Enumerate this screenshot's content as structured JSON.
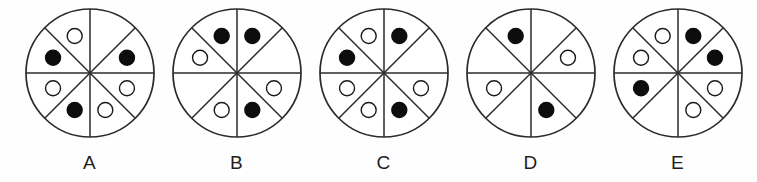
{
  "figure": {
    "background_color": "#fefefe",
    "stroke_color": "#2b2b2b",
    "dot_fill_black": "#0d0d0d",
    "dot_fill_white": "#ffffff",
    "dot_stroke_color": "#1a1a1a",
    "sector_count": 8,
    "circle_radius": 64,
    "dot_radius": 7.5,
    "dot_orbit_radius": 40,
    "sector_names": [
      "top-right",
      "right-upper",
      "right-lower",
      "bottom-right",
      "bottom-left",
      "left-lower",
      "left-upper",
      "top-left"
    ],
    "items": [
      {
        "label": "A",
        "name": "circle-a",
        "black_count": 3,
        "white_count": 4,
        "empty_count": 1,
        "sectors": [
          {
            "sector": "top-right",
            "dot": "none"
          },
          {
            "sector": "right-upper",
            "dot": "black"
          },
          {
            "sector": "right-lower",
            "dot": "white"
          },
          {
            "sector": "bottom-right",
            "dot": "white"
          },
          {
            "sector": "bottom-left",
            "dot": "black"
          },
          {
            "sector": "left-lower",
            "dot": "white"
          },
          {
            "sector": "left-upper",
            "dot": "black"
          },
          {
            "sector": "top-left",
            "dot": "white"
          }
        ]
      },
      {
        "label": "B",
        "name": "circle-b",
        "black_count": 3,
        "white_count": 3,
        "empty_count": 2,
        "sectors": [
          {
            "sector": "top-right",
            "dot": "black"
          },
          {
            "sector": "right-upper",
            "dot": "none"
          },
          {
            "sector": "right-lower",
            "dot": "white"
          },
          {
            "sector": "bottom-right",
            "dot": "black"
          },
          {
            "sector": "bottom-left",
            "dot": "white"
          },
          {
            "sector": "left-lower",
            "dot": "none"
          },
          {
            "sector": "left-upper",
            "dot": "white"
          },
          {
            "sector": "top-left",
            "dot": "black"
          }
        ]
      },
      {
        "label": "C",
        "name": "circle-c",
        "black_count": 3,
        "white_count": 4,
        "empty_count": 1,
        "sectors": [
          {
            "sector": "top-right",
            "dot": "black"
          },
          {
            "sector": "right-upper",
            "dot": "none"
          },
          {
            "sector": "right-lower",
            "dot": "white"
          },
          {
            "sector": "bottom-right",
            "dot": "black"
          },
          {
            "sector": "bottom-left",
            "dot": "white"
          },
          {
            "sector": "left-lower",
            "dot": "white"
          },
          {
            "sector": "left-upper",
            "dot": "black"
          },
          {
            "sector": "top-left",
            "dot": "white"
          }
        ]
      },
      {
        "label": "D",
        "name": "circle-d",
        "black_count": 2,
        "white_count": 2,
        "empty_count": 4,
        "sectors": [
          {
            "sector": "top-right",
            "dot": "none"
          },
          {
            "sector": "right-upper",
            "dot": "white"
          },
          {
            "sector": "right-lower",
            "dot": "none"
          },
          {
            "sector": "bottom-right",
            "dot": "black"
          },
          {
            "sector": "bottom-left",
            "dot": "none"
          },
          {
            "sector": "left-lower",
            "dot": "white"
          },
          {
            "sector": "left-upper",
            "dot": "none"
          },
          {
            "sector": "top-left",
            "dot": "black"
          }
        ]
      },
      {
        "label": "E",
        "name": "circle-e",
        "black_count": 3,
        "white_count": 4,
        "empty_count": 1,
        "sectors": [
          {
            "sector": "top-right",
            "dot": "black"
          },
          {
            "sector": "right-upper",
            "dot": "black"
          },
          {
            "sector": "right-lower",
            "dot": "white"
          },
          {
            "sector": "bottom-right",
            "dot": "white"
          },
          {
            "sector": "bottom-left",
            "dot": "none"
          },
          {
            "sector": "left-lower",
            "dot": "black"
          },
          {
            "sector": "left-upper",
            "dot": "white"
          },
          {
            "sector": "top-left",
            "dot": "white"
          }
        ]
      }
    ]
  }
}
